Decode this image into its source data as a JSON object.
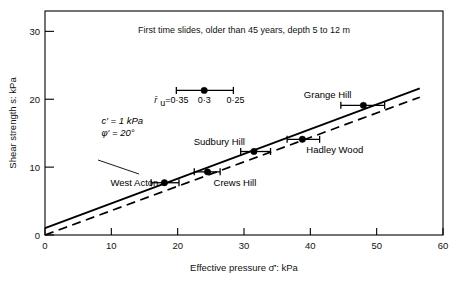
{
  "chart_data": {
    "type": "scatter",
    "title": "First time slides, older than 45 years, depth 5 to 12 m",
    "xlabel": "Effective pressure σ̄′: kPa",
    "ylabel": "Shear strength s: kPa",
    "xlim": [
      0,
      60
    ],
    "ylim": [
      0,
      33
    ],
    "xticks": [
      0,
      10,
      20,
      30,
      40,
      50,
      60
    ],
    "xtick_labels": [
      "0",
      "10",
      "20",
      "30",
      "40",
      "50",
      "60"
    ],
    "yticks": [
      0,
      10,
      20,
      30
    ],
    "ytick_labels": [
      "0",
      "10",
      "20",
      "30"
    ],
    "grid": false,
    "legend_position": "inside-upper-left",
    "points": [
      {
        "label": "West Acton",
        "x": 18.0,
        "y": 7.7,
        "xerr_low": 16.0,
        "xerr_high": 20.2,
        "label_dx": -6,
        "label_dy": 3,
        "label_anchor": "end"
      },
      {
        "label": "Crews Hill",
        "x": 24.5,
        "y": 9.3,
        "xerr_low": 22.5,
        "xerr_high": 26.4,
        "label_dx": 6,
        "label_dy": 14,
        "label_anchor": "start"
      },
      {
        "label": "Sudbury Hill",
        "x": 31.5,
        "y": 12.3,
        "xerr_low": 29.5,
        "xerr_high": 34.0,
        "label_dx": -9,
        "label_dy": -7,
        "label_anchor": "end"
      },
      {
        "label": "Hadley Wood",
        "x": 38.8,
        "y": 14.1,
        "xerr_low": 36.5,
        "xerr_high": 41.4,
        "label_dx": 4,
        "label_dy": 14,
        "label_anchor": "start"
      },
      {
        "label": "Grange Hill",
        "x": 48.0,
        "y": 19.1,
        "xerr_low": 44.6,
        "xerr_high": 51.2,
        "label_dx": -12,
        "label_dy": -7,
        "label_anchor": "end"
      }
    ],
    "series": [
      {
        "name": "c' = 1 kPa, phi' = 20 deg",
        "style": "solid",
        "x": [
          0,
          56.5
        ],
        "y": [
          1.0,
          21.6
        ]
      },
      {
        "name": "lower bound",
        "style": "dashed",
        "x": [
          0,
          56.5
        ],
        "y": [
          0.0,
          20.3
        ]
      }
    ],
    "legend_marker": {
      "x": 24.0,
      "y": 21.3,
      "xerr_low": 19.8,
      "xerr_high": 28.4,
      "text_prefix": "r̄",
      "text_sub": "u",
      "text_eq": "=0·35",
      "text_mid": "0·3",
      "text_high": "0·25"
    },
    "annotations": [
      {
        "name": "cohesion",
        "text": "c′ = 1 kPa",
        "x": 8.5,
        "y": 16.3
      },
      {
        "name": "friction-angle",
        "text": "φ′ = 20°",
        "x": 8.5,
        "y": 14.6
      }
    ]
  },
  "colors": {
    "background": "#ffffff",
    "ink": "#000000",
    "axis": "#000000"
  }
}
